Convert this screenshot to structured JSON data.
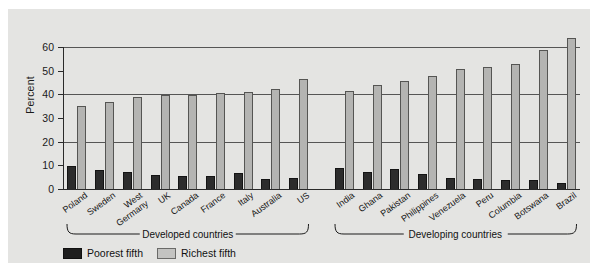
{
  "chart_data": {
    "type": "bar",
    "title": "",
    "xlabel": "",
    "ylabel": "Percent",
    "ylim": [
      0,
      60
    ],
    "yticks": [
      0,
      10,
      20,
      30,
      40,
      50,
      60
    ],
    "gridlines_at": [
      20,
      40,
      60
    ],
    "grid": true,
    "legend_position": "bottom-left",
    "categories": [
      "Poland",
      "Sweden",
      "West\nGermany",
      "UK",
      "Canada",
      "France",
      "Italy",
      "Australia",
      "US",
      "India",
      "Ghana",
      "Pakistan",
      "Philippines",
      "Venezuela",
      "Peru",
      "Columbia",
      "Botswana",
      "Brazil"
    ],
    "series": [
      {
        "name": "Poorest fifth",
        "color": "#2c2c2c",
        "values": [
          9.7,
          8.0,
          7.0,
          5.8,
          5.7,
          5.6,
          6.8,
          4.4,
          4.7,
          8.8,
          7.1,
          8.4,
          6.5,
          4.7,
          4.4,
          4.0,
          3.6,
          2.4
        ]
      },
      {
        "name": "Richest fifth",
        "color": "#b4b4b2",
        "values": [
          35.2,
          36.9,
          38.7,
          39.8,
          39.8,
          40.4,
          41.0,
          42.2,
          46.3,
          41.4,
          44.1,
          45.6,
          47.8,
          50.6,
          51.4,
          53.0,
          58.9,
          64.0
        ]
      }
    ],
    "groups": [
      {
        "label": "Developed countries",
        "start": 0,
        "end": 8
      },
      {
        "label": "Developing countries",
        "start": 9,
        "end": 17
      }
    ]
  },
  "legend": {
    "items": [
      {
        "label": "Poorest fifth",
        "swatch": "poor"
      },
      {
        "label": "Richest fifth",
        "swatch": "rich"
      }
    ]
  }
}
